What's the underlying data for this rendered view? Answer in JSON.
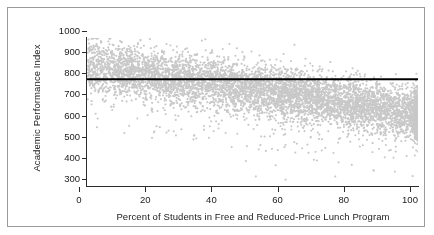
{
  "figure": {
    "border_color": "#9a9a9a"
  },
  "chart_data": {
    "type": "scatter",
    "title": "",
    "xlabel": "Percent of Students in Free and Reduced-Price Lunch Program",
    "ylabel": "Academic Performance Index",
    "xlim": [
      0,
      100
    ],
    "ylim": [
      300,
      1000
    ],
    "xticks": [
      0,
      20,
      40,
      60,
      80,
      100
    ],
    "yticks": [
      300,
      400,
      500,
      600,
      700,
      800,
      900,
      1000
    ],
    "xtick_labels": [
      "0",
      "20",
      "40",
      "60",
      "80",
      "100"
    ],
    "ytick_labels": [
      "300",
      "400",
      "500",
      "600",
      "700",
      "800",
      "900",
      "1000"
    ],
    "grid": false,
    "legend": null,
    "point_color": "#c8c8c8",
    "point_size": 2.1,
    "point_count": 6400,
    "marker": "circle",
    "annotations": [
      {
        "kind": "horizontal-reference-line",
        "label": "statewide API performance target",
        "y": 805,
        "color": "#000000",
        "width": 2,
        "x_start": 0,
        "x_end": 100
      }
    ],
    "series": [
      {
        "name": "California schools",
        "description": "Each point is one school: percent of students in free and reduced-price lunch program vs. Academic Performance Index.",
        "trend": "negative",
        "fit_intercept": 872,
        "fit_slope": -2.3,
        "spread_sd_at_x0": 62,
        "spread_sd_at_x100": 58,
        "x_distribution": "roughly uniform 0-100 with heavy pile-up at 100",
        "x_density_boost_at_100": 0.06,
        "sample_points": [
          [
            1,
            960
          ],
          [
            1,
            905
          ],
          [
            2,
            868
          ],
          [
            2,
            812
          ],
          [
            3,
            935
          ],
          [
            3,
            793
          ],
          [
            4,
            845
          ],
          [
            5,
            888
          ],
          [
            5,
            760
          ],
          [
            6,
            912
          ],
          [
            7,
            858
          ],
          [
            8,
            925
          ],
          [
            9,
            880
          ],
          [
            10,
            986
          ],
          [
            11,
            840
          ],
          [
            12,
            872
          ],
          [
            13,
            905
          ],
          [
            14,
            828
          ],
          [
            15,
            861
          ],
          [
            16,
            845
          ],
          [
            18,
            880
          ],
          [
            20,
            858
          ],
          [
            21,
            962
          ],
          [
            22,
            815
          ],
          [
            24,
            840
          ],
          [
            26,
            872
          ],
          [
            28,
            832
          ],
          [
            30,
            805
          ],
          [
            32,
            898
          ],
          [
            33,
            760
          ],
          [
            34,
            788
          ],
          [
            36,
            842
          ],
          [
            38,
            820
          ],
          [
            40,
            795
          ],
          [
            41,
            948
          ],
          [
            42,
            775
          ],
          [
            44,
            808
          ],
          [
            46,
            765
          ],
          [
            48,
            742
          ],
          [
            50,
            785
          ],
          [
            52,
            718
          ],
          [
            54,
            752
          ],
          [
            56,
            862
          ],
          [
            58,
            725
          ],
          [
            60,
            700
          ],
          [
            62,
            738
          ],
          [
            64,
            690
          ],
          [
            66,
            712
          ],
          [
            68,
            675
          ],
          [
            70,
            702
          ],
          [
            72,
            660
          ],
          [
            74,
            688
          ],
          [
            76,
            645
          ],
          [
            78,
            672
          ],
          [
            80,
            700
          ],
          [
            82,
            635
          ],
          [
            84,
            828
          ],
          [
            86,
            658
          ],
          [
            88,
            620
          ],
          [
            90,
            648
          ],
          [
            92,
            612
          ],
          [
            94,
            640
          ],
          [
            96,
            602
          ],
          [
            98,
            628
          ],
          [
            100,
            660
          ],
          [
            100,
            585
          ],
          [
            100,
            520
          ],
          [
            100,
            700
          ],
          [
            100,
            462
          ],
          [
            3,
            578
          ],
          [
            21,
            583
          ],
          [
            33,
            525
          ],
          [
            48,
            418
          ],
          [
            51,
            345
          ],
          [
            57,
            398
          ],
          [
            60,
            330
          ],
          [
            65,
            478
          ],
          [
            72,
            480
          ],
          [
            75,
            345
          ],
          [
            76,
            412
          ],
          [
            80,
            400
          ],
          [
            93,
            368
          ]
        ]
      }
    ]
  }
}
